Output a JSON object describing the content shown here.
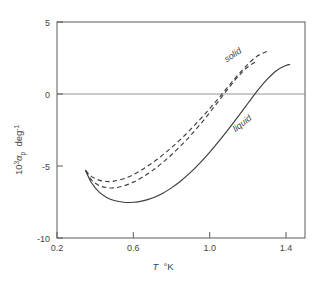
{
  "chart_data": {
    "type": "line",
    "title": "",
    "xlabel": "T  °K",
    "ylabel": "10³αₚ  deg⁻¹",
    "ylabel_parts": {
      "base": "10",
      "exponent": "3",
      "symbol": "α",
      "subscript": "p",
      "unit": "deg",
      "unit_exponent": "-1"
    },
    "xlim": [
      0.2,
      1.5
    ],
    "ylim": [
      -10,
      5
    ],
    "xticks": [
      0.2,
      0.6,
      1.0,
      1.4
    ],
    "xtick_labels": [
      "0.2",
      "0.6",
      "1.0",
      "1.4"
    ],
    "yticks": [
      5,
      0,
      -5,
      -10
    ],
    "ytick_labels": [
      "5",
      "0",
      "-5",
      "-10"
    ],
    "grid": false,
    "legend_position": "inline-annotation",
    "zero_reference_line": 0,
    "annotations": [
      {
        "text": "solid",
        "x": 1.13,
        "y": 2.55,
        "rotation": -34,
        "style": "italic"
      },
      {
        "text": "liquid",
        "x": 1.18,
        "y": -2.2,
        "rotation": -38,
        "style": "italic"
      }
    ],
    "series": [
      {
        "name": "solid",
        "label": "solid",
        "style": "dashed",
        "color": "#3d3d3d",
        "x": [
          0.35,
          0.38,
          0.42,
          0.46,
          0.5,
          0.55,
          0.6,
          0.65,
          0.7,
          0.75,
          0.8,
          0.85,
          0.9,
          0.95,
          1.0,
          1.05,
          1.1,
          1.15,
          1.2,
          1.25,
          1.3
        ],
        "y": [
          -5.3,
          -5.72,
          -5.98,
          -6.08,
          -6.05,
          -5.88,
          -5.6,
          -5.22,
          -4.78,
          -4.28,
          -3.72,
          -3.12,
          -2.46,
          -1.76,
          -1.02,
          -0.24,
          0.56,
          1.34,
          2.06,
          2.64,
          2.95
        ]
      },
      {
        "name": "solid-second-branch",
        "label": "solid",
        "style": "dashed",
        "color": "#3d3d3d",
        "x": [
          0.35,
          0.38,
          0.42,
          0.46,
          0.5,
          0.55,
          0.6,
          0.65,
          0.7,
          0.75,
          0.8,
          0.85,
          0.9,
          0.95,
          1.0,
          1.05,
          1.1,
          1.15,
          1.2,
          1.25
        ],
        "y": [
          -5.35,
          -5.95,
          -6.35,
          -6.5,
          -6.52,
          -6.38,
          -6.12,
          -5.76,
          -5.32,
          -4.8,
          -4.22,
          -3.58,
          -2.88,
          -2.12,
          -1.3,
          -0.44,
          0.42,
          1.22,
          1.88,
          2.3
        ]
      },
      {
        "name": "liquid",
        "label": "liquid",
        "style": "solid",
        "color": "#3d3d3d",
        "x": [
          0.35,
          0.38,
          0.42,
          0.46,
          0.5,
          0.55,
          0.6,
          0.65,
          0.7,
          0.75,
          0.8,
          0.85,
          0.9,
          0.95,
          1.0,
          1.05,
          1.1,
          1.15,
          1.2,
          1.25,
          1.3,
          1.35,
          1.4,
          1.42
        ],
        "y": [
          -5.3,
          -6.15,
          -6.8,
          -7.18,
          -7.4,
          -7.52,
          -7.52,
          -7.42,
          -7.22,
          -6.92,
          -6.52,
          -6.02,
          -5.44,
          -4.78,
          -4.05,
          -3.26,
          -2.42,
          -1.55,
          -0.66,
          0.22,
          1.0,
          1.62,
          1.98,
          2.05
        ]
      }
    ]
  },
  "axes": {
    "x_axis_name": "temperature-axis",
    "y_axis_name": "expansion-coefficient-axis"
  }
}
